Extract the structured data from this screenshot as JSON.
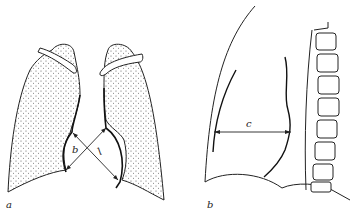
{
  "figure": {
    "panels": [
      {
        "id": "a",
        "label": "a",
        "description": "Frontal chest view: lungs (stippled) with crossing measurement lines",
        "measurement_labels": [
          "b",
          "l"
        ]
      },
      {
        "id": "b",
        "label": "b",
        "description": "Lateral chest view with spine and horizontal measurement line",
        "measurement_labels": [
          "c"
        ]
      }
    ]
  },
  "colors": {
    "line": "#222222",
    "background": "#ffffff",
    "stipple": "#555555"
  }
}
